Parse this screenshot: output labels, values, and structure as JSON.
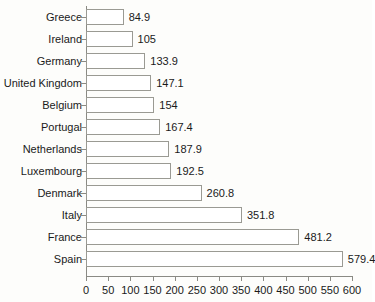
{
  "chart_data": {
    "type": "bar",
    "orientation": "horizontal",
    "title": "",
    "subtitle": "",
    "xlabel": "",
    "ylabel": "",
    "xlim": [
      0,
      600
    ],
    "ylim": null,
    "grid": false,
    "legend": null,
    "xticks": [
      0,
      50,
      100,
      150,
      200,
      250,
      300,
      350,
      400,
      450,
      500,
      550,
      600
    ],
    "xtick_labels": [
      "0",
      "50",
      "100",
      "150",
      "200",
      "250",
      "300",
      "350",
      "400",
      "450",
      "500",
      "550",
      "600"
    ],
    "categories": [
      "Greece",
      "Ireland",
      "Germany",
      "United Kingdom",
      "Belgium",
      "Portugal",
      "Netherlands",
      "Luxembourg",
      "Denmark",
      "Italy",
      "France",
      "Spain"
    ],
    "values": [
      84.9,
      105,
      133.9,
      147.1,
      154,
      167.4,
      187.9,
      192.5,
      260.8,
      351.8,
      481.2,
      579.4
    ],
    "value_labels": [
      "84.9",
      "105",
      "133.9",
      "147.1",
      "154",
      "167.4",
      "187.9",
      "192.5",
      "260.8",
      "351.8",
      "481.2",
      "579.4"
    ],
    "bar_fill": "#ffffff",
    "bar_border": "#9a9a93",
    "axis_color": "#8a8a84",
    "text_color": "#1a1a1a",
    "background": "#fdfdfb"
  }
}
